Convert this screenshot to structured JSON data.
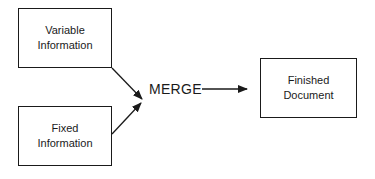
{
  "diagram": {
    "inputs": [
      {
        "line1": "Variable",
        "line2": "Information"
      },
      {
        "line1": "Fixed",
        "line2": "Information"
      }
    ],
    "process": "MERGE",
    "output": {
      "line1": "Finished",
      "line2": "Document"
    },
    "colors": {
      "stroke": "#1a1a1a",
      "background": "#ffffff"
    }
  }
}
